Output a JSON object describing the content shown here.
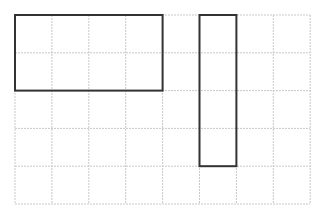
{
  "diagram": {
    "type": "grid-rectangles",
    "grid": {
      "columns": 8,
      "rows": 5,
      "origin_x": 15,
      "origin_y": 15,
      "cell_width": 36.9,
      "cell_height": 37.8,
      "line_color": "#c8c8c8",
      "line_style": "dashed"
    },
    "rectangles": [
      {
        "name": "rectangle-horizontal",
        "col": 0,
        "row": 0,
        "width_cells": 4,
        "height_cells": 2,
        "stroke": "#333333",
        "stroke_width": 2
      },
      {
        "name": "rectangle-vertical",
        "col": 5,
        "row": 0,
        "width_cells": 1,
        "height_cells": 4,
        "stroke": "#333333",
        "stroke_width": 2
      }
    ]
  }
}
